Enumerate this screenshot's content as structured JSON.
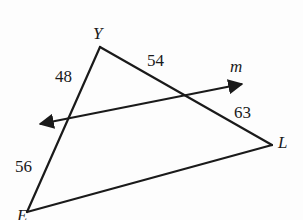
{
  "figure": {
    "background_color": "#fdfdfd",
    "stroke_color": "#1a1a1a",
    "vertices": [
      {
        "name": "Y",
        "label": "Y",
        "x": 100,
        "y": 47,
        "label_x": 93,
        "label_y": 25
      },
      {
        "name": "E",
        "label": "E",
        "x": 27,
        "y": 212,
        "label_x": 17,
        "label_y": 207
      },
      {
        "name": "L",
        "label": "L",
        "x": 272,
        "y": 145,
        "label_x": 278,
        "label_y": 134
      }
    ],
    "sides": [
      {
        "name": "YE",
        "measure": "48",
        "label_x": 55,
        "label_y": 68
      },
      {
        "name": "YL",
        "measure": "54",
        "label_x": 147,
        "label_y": 52
      },
      {
        "name": "LY_lower",
        "measure": "63",
        "label_x": 234,
        "label_y": 104
      },
      {
        "name": "EY_lower",
        "measure": "56",
        "label_x": 15,
        "label_y": 158
      }
    ],
    "transversal": {
      "name": "m",
      "label": "m",
      "label_x": 230,
      "label_y": 58,
      "arrow_left": {
        "x": 32,
        "y": 126
      },
      "arrow_right": {
        "x": 248,
        "y": 83
      }
    }
  }
}
